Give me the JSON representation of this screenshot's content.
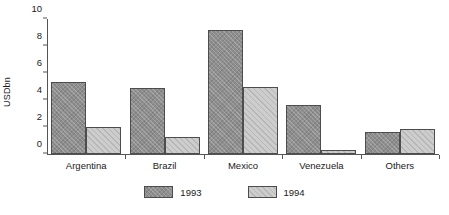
{
  "chart_data": {
    "type": "bar",
    "title": "",
    "xlabel": "",
    "ylabel": "USDbn",
    "ylim": [
      0,
      10
    ],
    "yticks": [
      0,
      2,
      4,
      6,
      8,
      10
    ],
    "grid": false,
    "legend_position": "bottom",
    "categories": [
      "Argentina",
      "Brazil",
      "Mexico",
      "Venezuela",
      "Others"
    ],
    "series": [
      {
        "name": "1993",
        "color": "#8e8e8e",
        "values": [
          5.3,
          4.9,
          9.2,
          3.6,
          1.6
        ]
      },
      {
        "name": "1994",
        "color": "#cdcdcd",
        "values": [
          2.0,
          1.25,
          5.0,
          0.3,
          1.85
        ]
      }
    ]
  }
}
